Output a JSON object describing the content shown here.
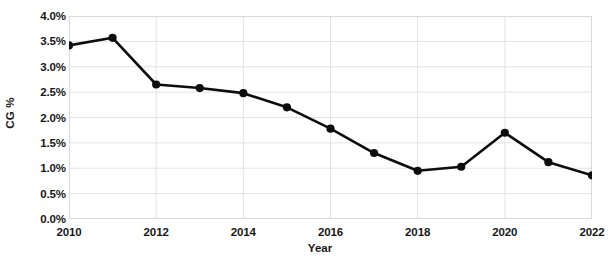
{
  "chart_data": {
    "type": "line",
    "title": "",
    "subtitle": "",
    "xlabel": "Year",
    "ylabel": "CG %",
    "x": [
      2010,
      2011,
      2012,
      2013,
      2014,
      2015,
      2016,
      2017,
      2018,
      2019,
      2020,
      2021,
      2022
    ],
    "values": [
      3.42,
      3.57,
      2.65,
      2.58,
      2.48,
      2.2,
      1.78,
      1.3,
      0.95,
      1.03,
      1.7,
      1.12,
      0.86
    ],
    "series": [
      {
        "name": "CG %",
        "values": [
          3.42,
          3.57,
          2.65,
          2.58,
          2.48,
          2.2,
          1.78,
          1.3,
          0.95,
          1.03,
          1.7,
          1.12,
          0.86
        ]
      }
    ],
    "xlim": [
      2010,
      2022
    ],
    "ylim": [
      0.0,
      4.0
    ],
    "ytick_labels": [
      "0.0%",
      "0.5%",
      "1.0%",
      "1.5%",
      "2.0%",
      "2.5%",
      "3.0%",
      "3.5%",
      "4.0%"
    ],
    "ytick_values": [
      0.0,
      0.5,
      1.0,
      1.5,
      2.0,
      2.5,
      3.0,
      3.5,
      4.0
    ],
    "xtick_labels": [
      "2010",
      "2012",
      "2014",
      "2016",
      "2018",
      "2020",
      "2022"
    ],
    "xtick_values": [
      2010,
      2012,
      2014,
      2016,
      2018,
      2020,
      2022
    ],
    "grid": {
      "horizontal": true,
      "vertical": true,
      "color": "#e3e3e3"
    },
    "legend": {
      "visible": false,
      "position": "none"
    },
    "style": {
      "line_color": "#0d0d0d",
      "line_width": 2.6,
      "marker": "circle",
      "marker_size": 7,
      "marker_color": "#0d0d0d",
      "plot_background": "#ffffff",
      "border_color": "#d9d9d9",
      "text_color": "#171717"
    }
  }
}
